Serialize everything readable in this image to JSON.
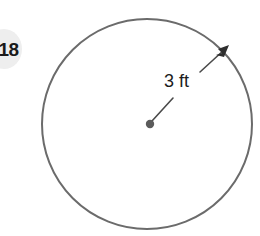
{
  "figure": {
    "type": "geometry-diagram",
    "shape": "circle",
    "background_color": "#ffffff",
    "stroke_color": "#6b6b6b",
    "annotation_color": "#3a3a3a",
    "text_color": "#1c1c1c",
    "circle": {
      "center_x": 147,
      "center_y": 124,
      "radius_px": 105,
      "stroke_width": 2
    },
    "center_dot": {
      "radius_px": 4,
      "fill": "#5b5b5b"
    },
    "radius_arrow": {
      "start_x": 150,
      "start_y": 122,
      "end_x": 228,
      "end_y": 47,
      "arrowhead": "at-circumference"
    },
    "radius_label": "3 ft",
    "measurement": {
      "value": 3,
      "unit": "ft",
      "quantity": "radius"
    }
  },
  "problem": {
    "number_badge": "18",
    "badge_background": "#eeeeee",
    "badge_clipped": "left"
  }
}
